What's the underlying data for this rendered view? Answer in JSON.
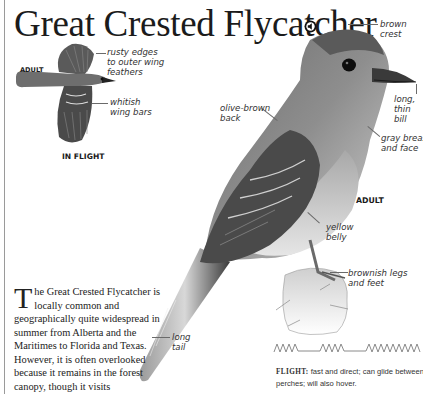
{
  "page": {
    "title": "Great Crested Flycatcher",
    "sound_icon": "speaker-icon"
  },
  "flight_illustration": {
    "age_label": "ADULT",
    "caption": "IN FLIGHT",
    "annotations": [
      {
        "id": "rusty-edges",
        "text": [
          "rusty edges",
          "to outer wing",
          "feathers"
        ]
      },
      {
        "id": "wing-bars",
        "text": [
          "whitish",
          "wing bars"
        ]
      }
    ]
  },
  "perched_illustration": {
    "age_label": "ADULT",
    "annotations": [
      {
        "id": "crest",
        "text": [
          "brown",
          "crest"
        ]
      },
      {
        "id": "bill",
        "text": [
          "long,",
          "thin",
          "bill"
        ]
      },
      {
        "id": "back",
        "text": [
          "olive-brown",
          "back"
        ]
      },
      {
        "id": "breast",
        "text": [
          "gray breast",
          "and face"
        ]
      },
      {
        "id": "belly",
        "text": [
          "yellow",
          "belly"
        ]
      },
      {
        "id": "legs",
        "text": [
          "brownish legs",
          "and feet"
        ]
      },
      {
        "id": "tail",
        "text": [
          "long",
          "tail"
        ]
      }
    ]
  },
  "intro": {
    "dropcap": "T",
    "text": "he Great Crested Flycatcher is locally common and geographically quite widespread in summer from Alberta and the Maritimes to Florida and Texas. However, it is often overlooked because it remains in the forest canopy, though it visits"
  },
  "flight": {
    "pattern_icon": "undulating-flight-pattern-icon",
    "label": "FLIGHT:",
    "description": "fast and direct; can glide between perches; will also hover."
  },
  "colors": {
    "text": "#1b1b1b",
    "leader_line": "#6a6a6a",
    "border": "#9a9a9a"
  }
}
